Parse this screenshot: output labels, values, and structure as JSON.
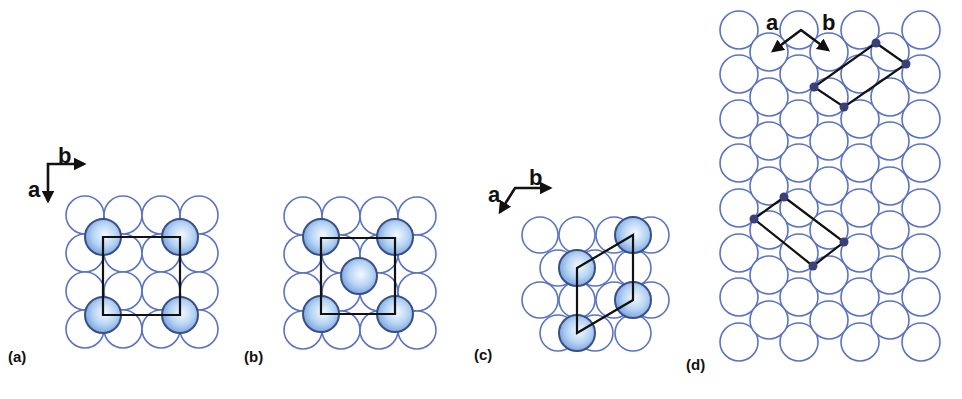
{
  "figure": {
    "width": 962,
    "height": 399,
    "colors": {
      "substrate_stroke": "#5b74c0",
      "adsorbate_fill_center": "#f2f8ff",
      "adsorbate_fill_edge": "#7eaee6",
      "adsorbate_stroke": "#3a4f88",
      "cell_line": "#111111",
      "dot": "#3a3f78",
      "text": "#111111"
    }
  },
  "panels": [
    {
      "id": "a",
      "label": "(a)",
      "label_pos": [
        8,
        362
      ],
      "axes": {
        "corner": [
          48,
          164
        ],
        "a_tip": [
          48,
          201
        ],
        "b_tip": [
          84,
          164
        ],
        "a_label": "a",
        "a_label_pos": [
          28,
          189
        ],
        "b_label": "b",
        "b_label_pos": [
          58,
          155
        ]
      },
      "substrate": {
        "radius": 19,
        "circles": [
          [
            85,
            215
          ],
          [
            123,
            215
          ],
          [
            161,
            215
          ],
          [
            199,
            215
          ],
          [
            85,
            253
          ],
          [
            123,
            253
          ],
          [
            161,
            253
          ],
          [
            199,
            253
          ],
          [
            85,
            291
          ],
          [
            123,
            291
          ],
          [
            161,
            291
          ],
          [
            199,
            291
          ],
          [
            85,
            329
          ],
          [
            123,
            329
          ],
          [
            161,
            329
          ],
          [
            199,
            329
          ]
        ]
      },
      "adsorbates": {
        "radius": 18,
        "circles": [
          [
            103,
            237
          ],
          [
            180,
            237
          ],
          [
            103,
            315
          ],
          [
            180,
            315
          ]
        ]
      },
      "cell": [
        [
          103,
          237
        ],
        [
          180,
          237
        ],
        [
          180,
          315
        ],
        [
          103,
          315
        ]
      ],
      "dots": []
    },
    {
      "id": "b",
      "label": "(b)",
      "label_pos": [
        244,
        362
      ],
      "axes": null,
      "substrate": {
        "radius": 19,
        "circles": [
          [
            303,
            216
          ],
          [
            341,
            216
          ],
          [
            379,
            216
          ],
          [
            417,
            216
          ],
          [
            303,
            254
          ],
          [
            341,
            254
          ],
          [
            379,
            254
          ],
          [
            417,
            254
          ],
          [
            303,
            292
          ],
          [
            341,
            292
          ],
          [
            379,
            292
          ],
          [
            417,
            292
          ],
          [
            303,
            330
          ],
          [
            341,
            330
          ],
          [
            379,
            330
          ],
          [
            417,
            330
          ]
        ]
      },
      "adsorbates": {
        "radius": 18,
        "circles": [
          [
            321,
            237
          ],
          [
            395,
            237
          ],
          [
            359,
            276
          ],
          [
            321,
            314
          ],
          [
            395,
            314
          ]
        ]
      },
      "cell": [
        [
          321,
          238
        ],
        [
          395,
          238
        ],
        [
          395,
          314
        ],
        [
          321,
          314
        ]
      ],
      "dots": []
    },
    {
      "id": "c",
      "label": "(c)",
      "label_pos": [
        474,
        360
      ],
      "axes": {
        "corner": [
          515,
          188
        ],
        "a_tip": [
          500,
          212
        ],
        "b_tip": [
          550,
          188
        ],
        "a_label": "a",
        "a_label_pos": [
          488,
          194
        ],
        "b_label": "b",
        "b_label_pos": [
          529,
          177
        ]
      },
      "substrate": {
        "radius": 18,
        "circles": [
          [
            540,
            235
          ],
          [
            577,
            235
          ],
          [
            614,
            235
          ],
          [
            651,
            235
          ],
          [
            558,
            268
          ],
          [
            595,
            268
          ],
          [
            633,
            268
          ],
          [
            540,
            300
          ],
          [
            577,
            300
          ],
          [
            614,
            300
          ],
          [
            651,
            300
          ],
          [
            558,
            333
          ],
          [
            595,
            333
          ],
          [
            633,
            333
          ]
        ]
      },
      "adsorbates": {
        "radius": 18,
        "circles": [
          [
            633,
            235
          ],
          [
            577,
            268
          ],
          [
            633,
            300
          ],
          [
            577,
            333
          ]
        ]
      },
      "cell": [
        [
          577,
          268
        ],
        [
          633,
          235
        ],
        [
          633,
          300
        ],
        [
          577,
          333
        ]
      ],
      "dots": []
    },
    {
      "id": "d",
      "label": "(d)",
      "label_pos": [
        686,
        370
      ],
      "axes": {
        "corner": [
          801,
          30
        ],
        "a_tip": [
          773,
          51
        ],
        "b_tip": [
          828,
          50
        ],
        "a_label": "a",
        "a_label_pos": [
          766,
          22
        ],
        "b_label": "b",
        "b_label_pos": [
          822,
          22
        ]
      },
      "substrate": {
        "radius": 19,
        "columns_even_x": [
          739,
          799,
          860,
          921
        ],
        "rows_even_y": [
          30,
          74,
          119,
          163,
          208,
          253,
          297,
          342
        ],
        "columns_odd_x": [
          769,
          829,
          890
        ],
        "rows_odd_y": [
          52,
          97,
          141,
          186,
          230,
          275,
          320
        ]
      },
      "adsorbates": {
        "radius": 0,
        "circles": []
      },
      "cells": [
        [
          [
            876,
            43
          ],
          [
            906,
            64
          ],
          [
            844,
            107
          ],
          [
            814,
            87
          ]
        ],
        [
          [
            784,
            197
          ],
          [
            844,
            242
          ],
          [
            813,
            266
          ],
          [
            754,
            219
          ]
        ]
      ],
      "dots": [
        [
          876,
          43
        ],
        [
          906,
          64
        ],
        [
          844,
          107
        ],
        [
          814,
          87
        ],
        [
          784,
          197
        ],
        [
          844,
          242
        ],
        [
          813,
          266
        ],
        [
          754,
          219
        ]
      ]
    }
  ]
}
